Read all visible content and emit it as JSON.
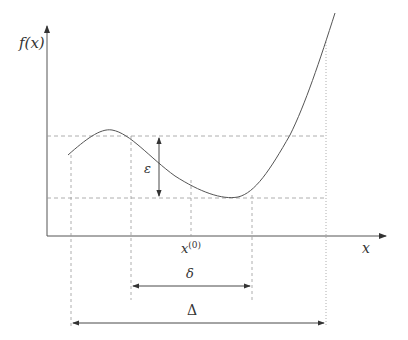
{
  "diagram": {
    "y_axis_label": "f(x)",
    "x_axis_label": "x",
    "point_label_base": "x",
    "point_label_sup": "(0)",
    "epsilon_label": "ε",
    "delta_small_label": "δ",
    "delta_large_label": "Δ",
    "colors": {
      "curve": "#555555",
      "axis": "#555555",
      "guide": "#999999"
    }
  }
}
